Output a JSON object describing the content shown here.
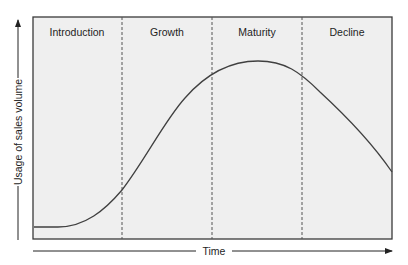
{
  "diagram": {
    "stages": [
      {
        "label": "Introduction"
      },
      {
        "label": "Growth"
      },
      {
        "label": "Maturity"
      },
      {
        "label": "Decline"
      }
    ],
    "x_axis_label": "Time",
    "y_axis_label": "Usage of sales volume",
    "colors": {
      "panel_fill": "#efefef",
      "border": "#3a3a3a",
      "curve": "#404040",
      "divider": "#555555"
    }
  }
}
